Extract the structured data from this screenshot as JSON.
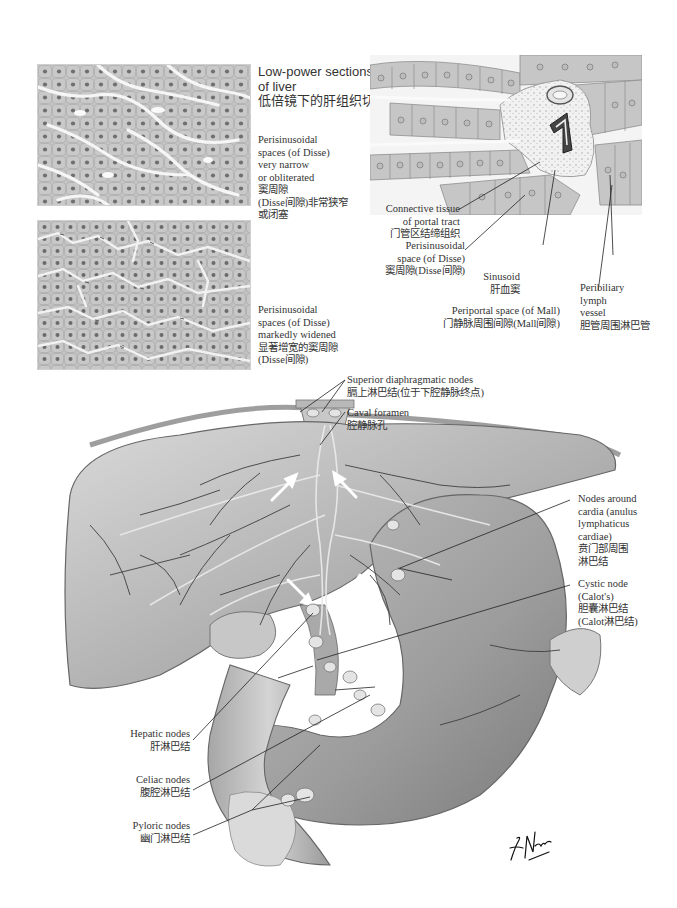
{
  "figure": {
    "top_panel": {
      "title": {
        "en_line1": "Low-power sections",
        "en_line2": "of liver",
        "zh": "低倍镜下的肝组织切片"
      },
      "histology_narrow": {
        "caption": [
          "Perisinusoidal",
          "spaces (of Disse)",
          "very narrow",
          "or obliterated",
          "窦周隙",
          "(Disse间隙)非常狭窄",
          "或闭塞"
        ]
      },
      "histology_widened": {
        "caption": [
          "Perisinusoidal",
          "spaces (of Disse)",
          "markedly widened",
          "显著增宽的窦周隙",
          "(Disse间隙)"
        ]
      }
    },
    "portal_tract_panel": {
      "labels": [
        {
          "id": "connective-tissue",
          "lines": [
            "Connective tissue",
            "of portal tract",
            "门管区结缔组织"
          ]
        },
        {
          "id": "perisinusoidal-space",
          "lines": [
            "Perisinusoidal",
            "space (of Disse)",
            "窦周隙(Disse间隙)"
          ]
        },
        {
          "id": "sinusoid",
          "lines": [
            "Sinusoid",
            "肝血窦"
          ]
        },
        {
          "id": "periportal-space",
          "lines": [
            "Periportal space (of Mall)",
            "门静脉周围间隙(Mall间隙)"
          ]
        },
        {
          "id": "peribiliary-lymph-vessel",
          "lines": [
            "Peribiliary",
            "lymph",
            "vessel",
            "胆管周围淋巴管"
          ]
        }
      ]
    },
    "lymphatics_panel": {
      "labels": [
        {
          "id": "superior-diaphragmatic-nodes",
          "lines": [
            "Superior diaphragmatic nodes",
            "膈上淋巴结(位于下腔静脉终点)"
          ]
        },
        {
          "id": "caval-foramen",
          "lines": [
            "Caval foramen",
            "腔静脉孔"
          ]
        },
        {
          "id": "nodes-around-cardia",
          "lines": [
            "Nodes around",
            "cardia (anulus",
            "lymphaticus",
            "cardiae)",
            "贲门部周围",
            "淋巴结"
          ]
        },
        {
          "id": "cystic-node",
          "lines": [
            "Cystic node",
            "(Calot's)",
            "胆囊淋巴结",
            "(Calot淋巴结)"
          ]
        },
        {
          "id": "hepatic-nodes",
          "lines": [
            "Hepatic nodes",
            "肝淋巴结"
          ]
        },
        {
          "id": "celiac-nodes",
          "lines": [
            "Celiac nodes",
            "腹腔淋巴结"
          ]
        },
        {
          "id": "pyloric-nodes",
          "lines": [
            "Pyloric nodes",
            "幽门淋巴结"
          ]
        }
      ],
      "signature": "F. Netter M.D."
    }
  }
}
